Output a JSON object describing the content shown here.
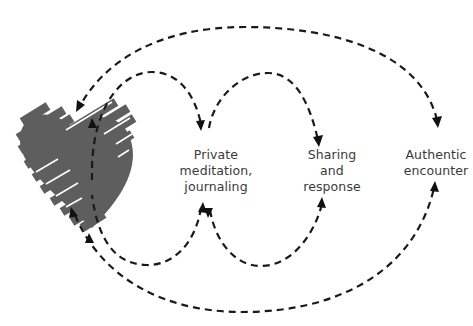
{
  "diagram": {
    "nodes": [
      {
        "id": "heart",
        "label": "",
        "shape": "striped-heart",
        "color": "#5e5e5e"
      },
      {
        "id": "private",
        "lines": [
          "Private",
          "meditation,",
          "journaling"
        ]
      },
      {
        "id": "sharing",
        "lines": [
          "Sharing",
          "and",
          "response"
        ]
      },
      {
        "id": "authentic",
        "lines": [
          "Authentic",
          "encounter"
        ]
      }
    ],
    "edges": [
      {
        "from": "heart",
        "to": "private",
        "route": "top",
        "style": "dashed"
      },
      {
        "from": "private",
        "to": "sharing",
        "route": "top",
        "style": "dashed"
      },
      {
        "from": "authentic",
        "to": "heart",
        "route": "top-outer",
        "style": "dashed"
      },
      {
        "from": "private",
        "to": "heart",
        "route": "bottom",
        "style": "dashed"
      },
      {
        "from": "private",
        "to": "sharing",
        "route": "bottom",
        "style": "dashed"
      },
      {
        "from": "heart",
        "to": "authentic",
        "route": "bottom-outer",
        "style": "dashed"
      }
    ],
    "colors": {
      "line": "#1a1a1a",
      "heart": "#5e5e5e",
      "text": "#3a3a3a"
    }
  }
}
